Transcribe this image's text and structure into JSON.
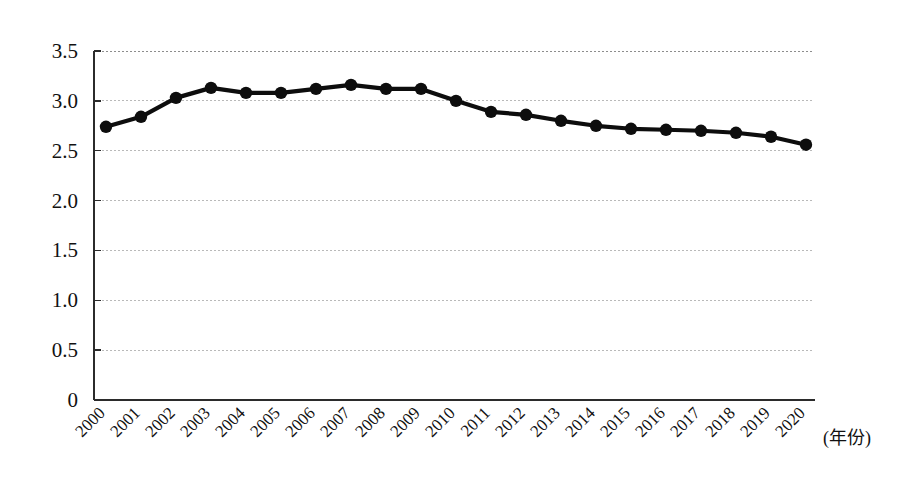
{
  "chart_data": {
    "type": "line",
    "title": "",
    "subtitle": "",
    "xlabel": "(年份)",
    "ylabel": "",
    "categories": [
      "2000",
      "2001",
      "2002",
      "2003",
      "2004",
      "2005",
      "2006",
      "2007",
      "2008",
      "2009",
      "2010",
      "2011",
      "2012",
      "2013",
      "2014",
      "2015",
      "2016",
      "2017",
      "2018",
      "2019",
      "2020"
    ],
    "values": [
      2.74,
      2.84,
      3.03,
      3.13,
      3.08,
      3.08,
      3.12,
      3.16,
      3.12,
      3.12,
      3.0,
      2.89,
      2.86,
      2.8,
      2.75,
      2.72,
      2.71,
      2.7,
      2.68,
      2.64,
      2.56
    ],
    "series": [
      {
        "name": "",
        "values": [
          2.74,
          2.84,
          3.03,
          3.13,
          3.08,
          3.08,
          3.12,
          3.16,
          3.12,
          3.12,
          3.0,
          2.89,
          2.86,
          2.8,
          2.75,
          2.72,
          2.71,
          2.7,
          2.68,
          2.64,
          2.56
        ]
      }
    ],
    "ylim": [
      0,
      3.5
    ],
    "yticks": [
      0,
      0.5,
      1.0,
      1.5,
      2.0,
      2.5,
      3.0,
      3.5
    ],
    "ytick_labels": [
      "0",
      "0.5",
      "1.0",
      "1.5",
      "2.0",
      "2.5",
      "3.0",
      "3.5"
    ],
    "grid": true,
    "grid_axis": "y",
    "legend": false,
    "legend_position": "none",
    "marker": "circle",
    "line_color": "#0d0d0d",
    "grid_color": "#b9b9b9",
    "axis_color": "#2b2b2b",
    "background": "#ffffff",
    "xtick_rotation": 45,
    "annotations": []
  },
  "axis_caption": {
    "text": "(年份)"
  }
}
